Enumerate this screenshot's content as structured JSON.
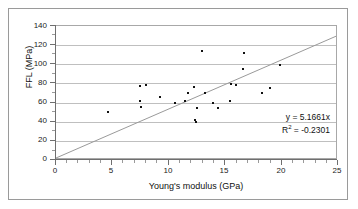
{
  "chart_data": {
    "type": "scatter",
    "title": "",
    "xlabel": "Young's modulus (GPa)",
    "ylabel": "FFL (MPa)",
    "xlim": [
      0,
      25
    ],
    "ylim": [
      0,
      140
    ],
    "xticks": [
      0,
      5,
      10,
      15,
      20,
      25
    ],
    "yticks": [
      0,
      20,
      40,
      60,
      80,
      100,
      120,
      140
    ],
    "grid": "horizontal",
    "legend": "none",
    "series": [
      {
        "name": "FFL vs Young's modulus",
        "marker": "small-square",
        "color": "#111111",
        "points": [
          {
            "x": 4.6,
            "y": 48.5
          },
          {
            "x": 7.5,
            "y": 76.0
          },
          {
            "x": 7.5,
            "y": 61.0
          },
          {
            "x": 7.6,
            "y": 54.5
          },
          {
            "x": 8.0,
            "y": 78.0
          },
          {
            "x": 9.3,
            "y": 64.5
          },
          {
            "x": 10.6,
            "y": 58.5
          },
          {
            "x": 11.5,
            "y": 60.0
          },
          {
            "x": 11.8,
            "y": 68.5
          },
          {
            "x": 12.3,
            "y": 75.0
          },
          {
            "x": 12.4,
            "y": 40.5
          },
          {
            "x": 12.5,
            "y": 38.0
          },
          {
            "x": 12.6,
            "y": 53.5
          },
          {
            "x": 13.0,
            "y": 113.5
          },
          {
            "x": 13.3,
            "y": 68.5
          },
          {
            "x": 14.0,
            "y": 58.5
          },
          {
            "x": 14.5,
            "y": 53.5
          },
          {
            "x": 15.5,
            "y": 60.5
          },
          {
            "x": 15.6,
            "y": 79.0
          },
          {
            "x": 16.1,
            "y": 77.0
          },
          {
            "x": 16.7,
            "y": 94.0
          },
          {
            "x": 16.8,
            "y": 111.5
          },
          {
            "x": 18.4,
            "y": 69.0
          },
          {
            "x": 19.1,
            "y": 74.0
          },
          {
            "x": 20.0,
            "y": 98.5
          }
        ]
      }
    ],
    "trendline": {
      "type": "linear",
      "slope": 5.1661,
      "intercept": 0,
      "x_start": 0,
      "x_end": 25,
      "color": "#9a9a9a"
    },
    "annotations": {
      "equation": "y = 5.1661x",
      "r_squared_prefix": "R",
      "r_squared_exponent": "2",
      "r_squared_value": " = -0.2301"
    }
  },
  "axis": {
    "y_tick_labels": [
      "140",
      "120",
      "100",
      "80",
      "60",
      "40",
      "20",
      "0"
    ],
    "x_tick_labels": [
      "0",
      "5",
      "10",
      "15",
      "20",
      "25"
    ],
    "y_title": "FFL (MPa)",
    "x_title": "Young's modulus (GPa)"
  },
  "colors": {
    "grid": "#bfbfbf",
    "axis": "#6f6f6f",
    "frame": "#9a9a9a",
    "marker": "#111111",
    "trendline": "#9a9a9a",
    "background": "#ffffff"
  }
}
